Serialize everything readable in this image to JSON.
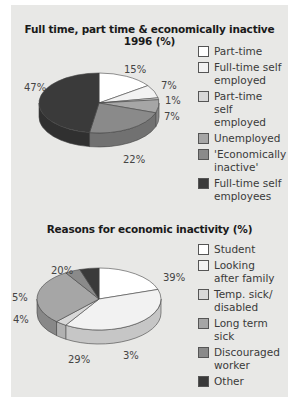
{
  "chart_data": [
    {
      "type": "pie",
      "title": "Full time, part time & economically inactive 1996 (%)",
      "categories": [
        "Part-time",
        "Full-time self employed",
        "Part-time self employed",
        "Unemployed",
        "'Economically inactive'",
        "Full-time self employees"
      ],
      "values": [
        15,
        7,
        1,
        7,
        22,
        47
      ],
      "labels": [
        "15%",
        "7%",
        "1%",
        "7%",
        "22%",
        "47%"
      ],
      "colors": [
        "#ffffff",
        "#f2f2f2",
        "#d8d8d8",
        "#a6a6a6",
        "#8a8a8a",
        "#3a3a3a"
      ],
      "legend_position": "right",
      "style": "3d"
    },
    {
      "type": "pie",
      "title": "Reasons for economic inactivity (%)",
      "categories": [
        "Student",
        "Looking after family",
        "Temp. sick/ disabled",
        "Long term sick",
        "Discouraged worker",
        "Other"
      ],
      "values": [
        20,
        39,
        3,
        29,
        4,
        5
      ],
      "labels": [
        "20%",
        "39%",
        "3%",
        "29%",
        "4%",
        "5%"
      ],
      "colors": [
        "#ffffff",
        "#f2f2f2",
        "#d8d8d8",
        "#a6a6a6",
        "#8a8a8a",
        "#3a3a3a"
      ],
      "legend_position": "right",
      "style": "3d"
    }
  ]
}
